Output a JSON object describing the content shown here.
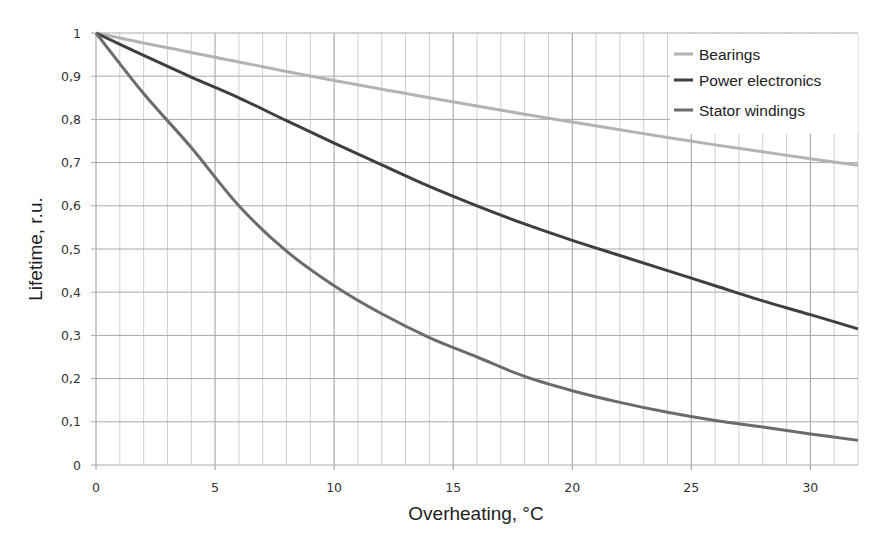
{
  "chart_data": {
    "type": "line",
    "title": "",
    "xlabel": "Overheating, °C",
    "ylabel": "Lifetime, r.u.",
    "xlim": [
      0,
      32
    ],
    "ylim": [
      0,
      1
    ],
    "x_ticks": [
      0,
      5,
      10,
      15,
      20,
      25,
      30
    ],
    "x_tick_labels": [
      "0",
      "5",
      "10",
      "15",
      "20",
      "25",
      "30"
    ],
    "y_ticks": [
      0,
      0.1,
      0.2,
      0.3,
      0.4,
      0.5,
      0.6,
      0.7,
      0.8,
      0.9,
      1
    ],
    "y_tick_labels": [
      "0",
      "0,1",
      "0,2",
      "0,3",
      "0,4",
      "0,5",
      "0,6",
      "0,7",
      "0,8",
      "0,9",
      "1"
    ],
    "grid": true,
    "minor_x_grid_step": 1,
    "legend_position": "upper right",
    "x": [
      0,
      2,
      4,
      6,
      8,
      10,
      12,
      14,
      16,
      18,
      20,
      22,
      24,
      26,
      28,
      30,
      32
    ],
    "series": [
      {
        "name": "Bearings",
        "color": "#b3b3b3",
        "values": [
          1,
          0.977,
          0.955,
          0.933,
          0.911,
          0.89,
          0.87,
          0.85,
          0.831,
          0.812,
          0.794,
          0.776,
          0.758,
          0.741,
          0.725,
          0.709,
          0.694
        ]
      },
      {
        "name": "Power electronics",
        "color": "#3f3f3f",
        "values": [
          1,
          0.948,
          0.898,
          0.85,
          0.797,
          0.745,
          0.695,
          0.645,
          0.6,
          0.558,
          0.52,
          0.485,
          0.45,
          0.415,
          0.38,
          0.348,
          0.315
        ]
      },
      {
        "name": "Stator windings",
        "color": "#6b6b6b",
        "values": [
          1,
          0.86,
          0.735,
          0.6,
          0.495,
          0.415,
          0.35,
          0.295,
          0.25,
          0.205,
          0.172,
          0.145,
          0.122,
          0.103,
          0.088,
          0.072,
          0.057
        ]
      }
    ]
  }
}
